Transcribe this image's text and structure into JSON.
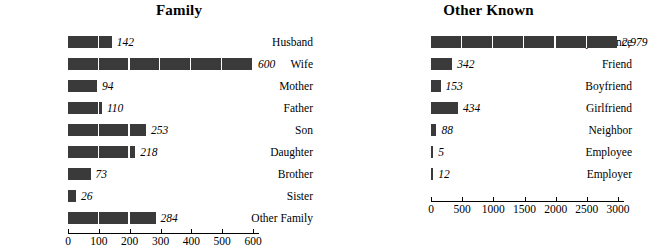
{
  "chart_data": [
    {
      "type": "bar",
      "orientation": "horizontal",
      "title": "Family",
      "xlabel": "",
      "ylabel": "",
      "categories": [
        "Husband",
        "Wife",
        "Mother",
        "Father",
        "Son",
        "Daughter",
        "Brother",
        "Sister",
        "Other Family"
      ],
      "values": [
        142,
        600,
        94,
        110,
        253,
        218,
        73,
        26,
        284
      ],
      "value_labels": [
        "142",
        "600",
        "94",
        "110",
        "253",
        "218",
        "73",
        "26",
        "284"
      ],
      "xlim": [
        0,
        600
      ],
      "xticks": [
        0,
        100,
        200,
        300,
        400,
        500,
        600
      ],
      "xtick_labels": [
        "0",
        "100",
        "200",
        "300",
        "400",
        "500",
        "600"
      ],
      "grid": false,
      "legend": "none",
      "bar_color": "#3a3a3a"
    },
    {
      "type": "bar",
      "orientation": "horizontal",
      "title": "Other Known",
      "xlabel": "",
      "ylabel": "",
      "categories": [
        "Acquaintance",
        "Friend",
        "Boyfriend",
        "Girlfriend",
        "Neighbor",
        "Employee",
        "Employer"
      ],
      "values": [
        2979,
        342,
        153,
        434,
        88,
        5,
        12
      ],
      "value_labels": [
        "2,979",
        "342",
        "153",
        "434",
        "88",
        "5",
        "12"
      ],
      "xlim": [
        0,
        3000
      ],
      "xticks": [
        0,
        500,
        1000,
        1500,
        2000,
        2500,
        3000
      ],
      "xtick_labels": [
        "0",
        "500",
        "1000",
        "1500",
        "2000",
        "2500",
        "3000"
      ],
      "grid": false,
      "legend": "none",
      "bar_color": "#3a3a3a"
    }
  ],
  "colors": {
    "background": "#ffffff",
    "bar": "#3a3a3a",
    "axis": "#000000",
    "text": "#000000"
  }
}
